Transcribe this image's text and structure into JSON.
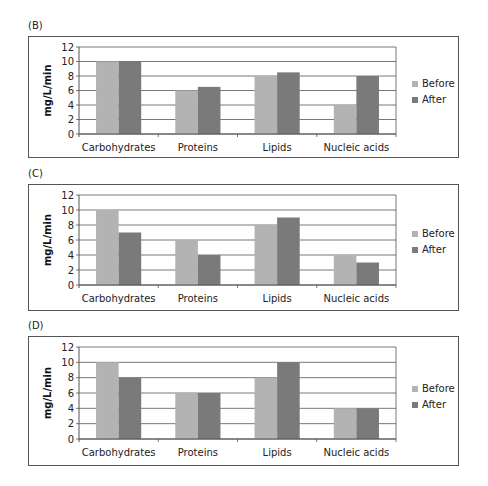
{
  "colors": {
    "before": "#b3b3b3",
    "after": "#7a7a7a",
    "grid": "#555555"
  },
  "chart_data": [
    {
      "panel": "(B)",
      "type": "bar",
      "title": "",
      "xlabel": "",
      "ylabel": "mg/L/min",
      "ylim": [
        0,
        12
      ],
      "yticks": [
        0,
        2,
        4,
        6,
        8,
        10,
        12
      ],
      "grid": true,
      "legend_position": "right",
      "categories": [
        "Carbohydrates",
        "Proteins",
        "Lipids",
        "Nucleic  acids"
      ],
      "series": [
        {
          "name": "Before",
          "values": [
            10,
            6,
            8,
            4
          ]
        },
        {
          "name": "After",
          "values": [
            10,
            6.5,
            8.5,
            8
          ]
        }
      ]
    },
    {
      "panel": "(C)",
      "type": "bar",
      "title": "",
      "xlabel": "",
      "ylabel": "mg/L/min",
      "ylim": [
        0,
        12
      ],
      "yticks": [
        0,
        2,
        4,
        6,
        8,
        10,
        12
      ],
      "grid": true,
      "legend_position": "right",
      "categories": [
        "Carbohydrates",
        "Proteins",
        "Lipids",
        "Nucleic  acids"
      ],
      "series": [
        {
          "name": "Before",
          "values": [
            10,
            6,
            8,
            4
          ]
        },
        {
          "name": "After",
          "values": [
            7,
            4,
            9,
            3
          ]
        }
      ]
    },
    {
      "panel": "(D)",
      "type": "bar",
      "title": "",
      "xlabel": "",
      "ylabel": "mg/L/min",
      "ylim": [
        0,
        12
      ],
      "yticks": [
        0,
        2,
        4,
        6,
        8,
        10,
        12
      ],
      "grid": true,
      "legend_position": "right",
      "categories": [
        "Carbohydrates",
        "Proteins",
        "Lipids",
        "Nucleic  acids"
      ],
      "series": [
        {
          "name": "Before",
          "values": [
            10,
            6,
            8,
            4
          ]
        },
        {
          "name": "After",
          "values": [
            8,
            6,
            10,
            4
          ]
        }
      ]
    }
  ]
}
